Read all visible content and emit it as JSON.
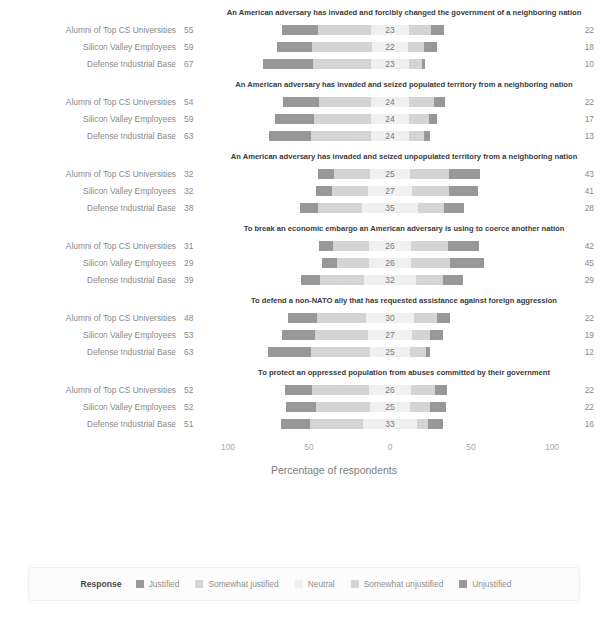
{
  "clipped_header_text": "",
  "axis": {
    "ticks": [
      "100",
      "50",
      "0",
      "50",
      "100"
    ],
    "title": "Percentage of respondents"
  },
  "legend": {
    "title": "Response",
    "items": [
      {
        "label": "Justified",
        "color": "#989898"
      },
      {
        "label": "Somewhat justified",
        "color": "#d4d4d4"
      },
      {
        "label": "Neutral",
        "color": "#f0f0f0"
      },
      {
        "label": "Somewhat unjustified",
        "color": "#d4d4d4"
      },
      {
        "label": "Unjustified",
        "color": "#989898"
      }
    ]
  },
  "groups": [
    "Alumni of Top CS Universities",
    "Silicon Valley Employees",
    "Defense Industrial Base"
  ],
  "chart_data": {
    "type": "bar",
    "subtype": "diverging-stacked-likert",
    "title": "",
    "xlabel": "Percentage of respondents",
    "ylabel": "",
    "xlim": [
      -100,
      100
    ],
    "xticks": [
      -100,
      -50,
      0,
      50,
      100
    ],
    "xticklabels": [
      "100",
      "50",
      "0",
      "50",
      "100"
    ],
    "grid": false,
    "legend_position": "bottom",
    "legend_title": "Response",
    "categories": [
      "Alumni of Top CS Universities",
      "Silicon Valley Employees",
      "Defense Industrial Base"
    ],
    "series": [
      {
        "name": "Justified",
        "color": "#989898"
      },
      {
        "name": "Somewhat justified",
        "color": "#d4d4d4"
      },
      {
        "name": "Neutral",
        "color": "#f0f0f0"
      },
      {
        "name": "Somewhat unjustified",
        "color": "#d4d4d4"
      },
      {
        "name": "Unjustified",
        "color": "#989898"
      }
    ],
    "panels": [
      {
        "title": "An American adversary has invaded and forcibly changed the government of a neighboring nation",
        "rows": [
          {
            "group": "Alumni of Top CS Universities",
            "left_total": 55,
            "neutral": 23,
            "right_total": 22,
            "values": {
              "justified": 22,
              "somewhat_justified": 33,
              "neutral": 23,
              "somewhat_unjustified": 14,
              "unjustified": 8
            }
          },
          {
            "group": "Silicon Valley Employees",
            "left_total": 59,
            "neutral": 22,
            "right_total": 18,
            "values": {
              "justified": 22,
              "somewhat_justified": 37,
              "neutral": 22,
              "somewhat_unjustified": 10,
              "unjustified": 8
            }
          },
          {
            "group": "Defense Industrial Base",
            "left_total": 67,
            "neutral": 23,
            "right_total": 10,
            "values": {
              "justified": 31,
              "somewhat_justified": 36,
              "neutral": 23,
              "somewhat_unjustified": 8,
              "unjustified": 2
            }
          }
        ]
      },
      {
        "title": "An American adversary has invaded and seized populated territory from a neighboring nation",
        "rows": [
          {
            "group": "Alumni of Top CS Universities",
            "left_total": 54,
            "neutral": 24,
            "right_total": 22,
            "values": {
              "justified": 22,
              "somewhat_justified": 32,
              "neutral": 24,
              "somewhat_unjustified": 15,
              "unjustified": 7
            }
          },
          {
            "group": "Silicon Valley Employees",
            "left_total": 59,
            "neutral": 24,
            "right_total": 17,
            "values": {
              "justified": 24,
              "somewhat_justified": 35,
              "neutral": 24,
              "somewhat_unjustified": 12,
              "unjustified": 5
            }
          },
          {
            "group": "Defense Industrial Base",
            "left_total": 63,
            "neutral": 24,
            "right_total": 13,
            "values": {
              "justified": 26,
              "somewhat_justified": 37,
              "neutral": 24,
              "somewhat_unjustified": 9,
              "unjustified": 4
            }
          }
        ]
      },
      {
        "title": "An American adversary has invaded and seized unpopulated territory from a neighboring nation",
        "rows": [
          {
            "group": "Alumni of Top CS Universities",
            "left_total": 32,
            "neutral": 25,
            "right_total": 43,
            "values": {
              "justified": 10,
              "somewhat_justified": 22,
              "neutral": 25,
              "somewhat_unjustified": 24,
              "unjustified": 19
            }
          },
          {
            "group": "Silicon Valley Employees",
            "left_total": 32,
            "neutral": 27,
            "right_total": 41,
            "values": {
              "justified": 10,
              "somewhat_justified": 22,
              "neutral": 27,
              "somewhat_unjustified": 23,
              "unjustified": 18
            }
          },
          {
            "group": "Defense Industrial Base",
            "left_total": 38,
            "neutral": 35,
            "right_total": 28,
            "values": {
              "justified": 11,
              "somewhat_justified": 27,
              "neutral": 35,
              "somewhat_unjustified": 16,
              "unjustified": 12
            }
          }
        ]
      },
      {
        "title": "To break an economic embargo an American adversary is using to coerce another nation",
        "rows": [
          {
            "group": "Alumni of Top CS Universities",
            "left_total": 31,
            "neutral": 26,
            "right_total": 42,
            "values": {
              "justified": 9,
              "somewhat_justified": 22,
              "neutral": 26,
              "somewhat_unjustified": 23,
              "unjustified": 19
            }
          },
          {
            "group": "Silicon Valley Employees",
            "left_total": 29,
            "neutral": 26,
            "right_total": 45,
            "values": {
              "justified": 9,
              "somewhat_justified": 20,
              "neutral": 26,
              "somewhat_unjustified": 24,
              "unjustified": 21
            }
          },
          {
            "group": "Defense Industrial Base",
            "left_total": 39,
            "neutral": 32,
            "right_total": 29,
            "values": {
              "justified": 12,
              "somewhat_justified": 27,
              "neutral": 32,
              "somewhat_unjustified": 17,
              "unjustified": 12
            }
          }
        ]
      },
      {
        "title": "To defend a non-NATO ally that has requested assistance against foreign aggression",
        "rows": [
          {
            "group": "Alumni of Top CS Universities",
            "left_total": 48,
            "neutral": 30,
            "right_total": 22,
            "values": {
              "justified": 18,
              "somewhat_justified": 30,
              "neutral": 30,
              "somewhat_unjustified": 14,
              "unjustified": 8
            }
          },
          {
            "group": "Silicon Valley Employees",
            "left_total": 53,
            "neutral": 27,
            "right_total": 19,
            "values": {
              "justified": 20,
              "somewhat_justified": 33,
              "neutral": 27,
              "somewhat_unjustified": 11,
              "unjustified": 8
            }
          },
          {
            "group": "Defense Industrial Base",
            "left_total": 63,
            "neutral": 25,
            "right_total": 12,
            "values": {
              "justified": 27,
              "somewhat_justified": 36,
              "neutral": 25,
              "somewhat_unjustified": 10,
              "unjustified": 2
            }
          }
        ]
      },
      {
        "title": "To protect an oppressed population from abuses committed by their government",
        "rows": [
          {
            "group": "Alumni of Top CS Universities",
            "left_total": 52,
            "neutral": 26,
            "right_total": 22,
            "values": {
              "justified": 17,
              "somewhat_justified": 35,
              "neutral": 26,
              "somewhat_unjustified": 15,
              "unjustified": 7
            }
          },
          {
            "group": "Silicon Valley Employees",
            "left_total": 52,
            "neutral": 25,
            "right_total": 22,
            "values": {
              "justified": 19,
              "somewhat_justified": 33,
              "neutral": 25,
              "somewhat_unjustified": 12,
              "unjustified": 10
            }
          },
          {
            "group": "Defense Industrial Base",
            "left_total": 51,
            "neutral": 33,
            "right_total": 16,
            "values": {
              "justified": 18,
              "somewhat_justified": 33,
              "neutral": 33,
              "somewhat_unjustified": 7,
              "unjustified": 9
            }
          }
        ]
      }
    ]
  }
}
